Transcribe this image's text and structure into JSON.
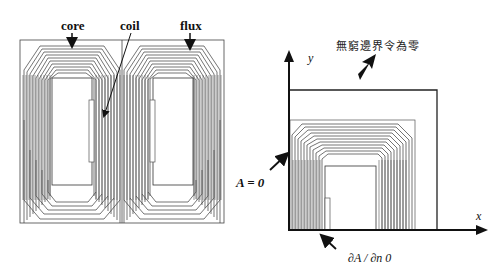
{
  "left_figure": {
    "labels": {
      "core": "core",
      "coil": "coil",
      "flux": "flux"
    }
  },
  "right_figure": {
    "boundary_note": "無窮邊界令為零",
    "axis_y_label": "y",
    "axis_x_label": "x",
    "dirichlet_label": "A = 0",
    "neumann_label": "∂A / ∂n    0"
  },
  "colors": {
    "ink": "#111111",
    "contour": "#3a3a3a",
    "background": "#ffffff"
  }
}
